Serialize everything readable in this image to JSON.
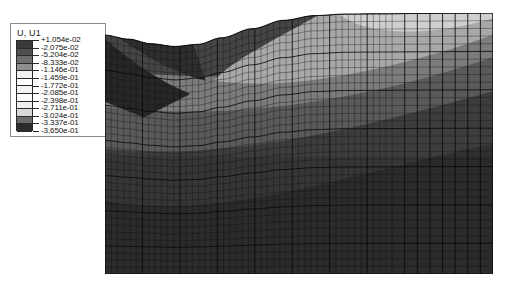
{
  "legend": {
    "title": "U, U1",
    "levels": [
      {
        "value": "+1.054e-02",
        "color": "#3a3a3a"
      },
      {
        "value": "-2.075e-02",
        "color": "#4f4f4f"
      },
      {
        "value": "-5.204e-02",
        "color": "#6e6e6e"
      },
      {
        "value": "-8.333e-02",
        "color": "#8e8e8e"
      },
      {
        "value": "-1.146e-01",
        "color": "#f2f2f2"
      },
      {
        "value": "-1.459e-01",
        "color": "#fdfdfd"
      },
      {
        "value": "-1.772e-01",
        "color": "#f4f4f4"
      },
      {
        "value": "-2.085e-01",
        "color": "#fbfbfb"
      },
      {
        "value": "-2.398e-01",
        "color": "#efefef"
      },
      {
        "value": "-2.711e-01",
        "color": "#d8d8d8"
      },
      {
        "value": "-3.024e-01",
        "color": "#6a6a6a"
      },
      {
        "value": "-3.337e-01",
        "color": "#2c2c2c"
      },
      {
        "value": "-3.650e-01",
        "color": "#1a1a1a"
      }
    ]
  },
  "chart_data": {
    "type": "heatmap",
    "title": "U, U1",
    "variable": "U, U1",
    "colormap": "grayscale",
    "contour_levels": [
      0.01054,
      -0.02075,
      -0.05204,
      -0.08333,
      -0.1146,
      -0.1459,
      -0.1772,
      -0.2085,
      -0.2398,
      -0.2711,
      -0.3024,
      -0.3337,
      -0.365
    ],
    "value_min": -0.365,
    "value_max": 0.01054,
    "legend_position": "top-left",
    "grid": true,
    "xlabel": "",
    "ylabel": "",
    "mesh": {
      "columns_fine": 46,
      "columns_coarse": 8,
      "rows_fine": 34,
      "fine_region_x_fraction": 0.74
    },
    "surface_profile": [
      {
        "x": 0.0,
        "y": 0.085
      },
      {
        "x": 0.06,
        "y": 0.1
      },
      {
        "x": 0.12,
        "y": 0.118
      },
      {
        "x": 0.18,
        "y": 0.128
      },
      {
        "x": 0.24,
        "y": 0.12
      },
      {
        "x": 0.3,
        "y": 0.095
      },
      {
        "x": 0.38,
        "y": 0.06
      },
      {
        "x": 0.46,
        "y": 0.028
      },
      {
        "x": 0.54,
        "y": 0.01
      },
      {
        "x": 0.62,
        "y": 0.004
      },
      {
        "x": 0.7,
        "y": 0.003
      },
      {
        "x": 0.8,
        "y": 0.002
      },
      {
        "x": 0.9,
        "y": 0.001
      },
      {
        "x": 1.0,
        "y": 0.0
      }
    ],
    "contour_bands": [
      {
        "level": "-1.146e-01",
        "region": "upper-right-light",
        "shade": "#d2d2d2"
      },
      {
        "level": "-2.398e-01",
        "region": "mid-right-medium",
        "shade": "#8c8c8c"
      },
      {
        "level": "-3.024e-01",
        "region": "lower-dark",
        "shade": "#4a4a4a"
      },
      {
        "level": "-3.650e-01",
        "region": "bottom-darkest",
        "shade": "#303030"
      }
    ]
  }
}
